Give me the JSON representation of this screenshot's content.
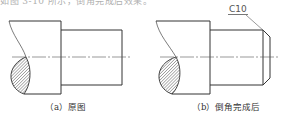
{
  "header": {
    "partial_text": "如图 3-10 所示，倒角完成后效果。"
  },
  "figures": [
    {
      "id": "a",
      "caption": "（a）原图"
    },
    {
      "id": "b",
      "caption": "（b）倒角完成后",
      "chamfer_label": "C10"
    }
  ],
  "colors": {
    "line": "#333333",
    "centerline": "#555555",
    "hatch": "#555555"
  }
}
